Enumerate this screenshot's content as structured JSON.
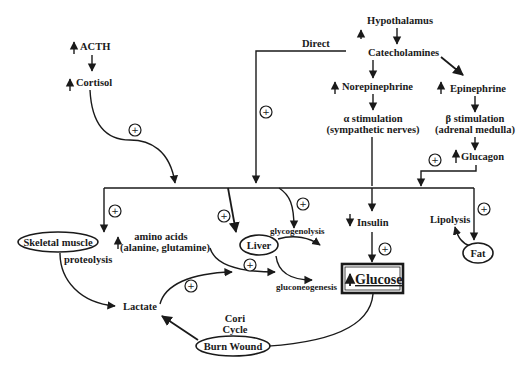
{
  "diagram": {
    "nodes": {
      "hypothalamus": "Hypothalamus",
      "catecholamines": "Catecholamines",
      "direct": "Direct",
      "norepinephrine": "Norepinephrine",
      "epinephrine": "Epinephrine",
      "alpha_stim_1": "α stimulation",
      "alpha_stim_2": "(sympathetic nerves)",
      "beta_stim_1": "β stimulation",
      "beta_stim_2": "(adrenal medulla)",
      "glucagon": "Glucagon",
      "acth": "ACTH",
      "cortisol": "Cortisol",
      "skeletal_muscle": "Skeletal muscle",
      "proteolysis": "proteolysis",
      "amino_acids_1": "amino acids",
      "amino_acids_2": "(alanine, glutamine)",
      "liver": "Liver",
      "glycogenolysis": "glycogenolysis",
      "gluconeogenesis": "gluconeogenesis",
      "insulin": "Insulin",
      "glucose": "Glucose",
      "lipolysis": "Lipolysis",
      "fat": "Fat",
      "lactate": "Lactate",
      "cori_1": "Cori",
      "cori_2": "Cycle",
      "burn_wound": "Burn Wound"
    },
    "symbols": {
      "plus": "+",
      "up_arrow": "increase",
      "down_arrow": "decrease"
    }
  }
}
